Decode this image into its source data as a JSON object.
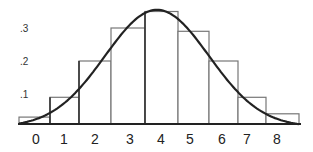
{
  "chart_data": {
    "type": "bar",
    "title": "",
    "xlabel": "",
    "ylabel": "",
    "categories": [
      "0",
      "1",
      "2",
      "3",
      "4",
      "5",
      "6",
      "7",
      "8"
    ],
    "values": [
      0.03,
      0.09,
      0.2,
      0.3,
      0.35,
      0.29,
      0.2,
      0.09,
      0.04
    ],
    "bar_edges_px": [
      19,
      50,
      79,
      111,
      145,
      178,
      209,
      238,
      266,
      299
    ],
    "overlay": "smooth bell-shaped (normal) curve approximating the histogram",
    "y_ticks": [
      ".1",
      ".2",
      ".3"
    ],
    "y_tick_values": [
      0.1,
      0.2,
      0.3
    ],
    "ylim": [
      0,
      0.36
    ],
    "grid": false,
    "legend": "none"
  }
}
